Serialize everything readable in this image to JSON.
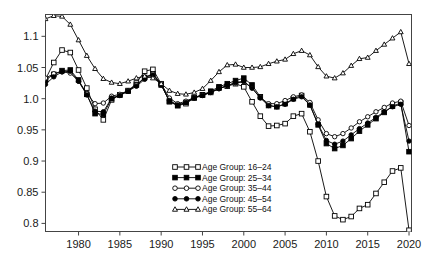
{
  "chart_data": {
    "type": "line",
    "title": "",
    "subtitle": "",
    "xlabel": "",
    "ylabel": "",
    "xlim": [
      1976,
      2020.3
    ],
    "ylim": [
      0.787,
      1.135
    ],
    "grid": false,
    "legend_position": "bottom-center",
    "xticks": [
      1980,
      1985,
      1990,
      1995,
      2000,
      2005,
      2010,
      2015,
      2020
    ],
    "xtick_labels": [
      "1980",
      "1985",
      "1990",
      "1995",
      "2000",
      "2005",
      "2010",
      "2015",
      "2020"
    ],
    "yticks": [
      0.8,
      0.85,
      0.9,
      0.95,
      1.0,
      1.05,
      1.1
    ],
    "ytick_labels": [
      "0.8",
      "0.85",
      "0.9",
      "0.95",
      "1.0",
      "1.05",
      "1.1"
    ],
    "x": [
      1976,
      1977,
      1978,
      1979,
      1980,
      1981,
      1982,
      1983,
      1984,
      1985,
      1986,
      1987,
      1988,
      1989,
      1990,
      1991,
      1992,
      1993,
      1994,
      1995,
      1996,
      1997,
      1998,
      1999,
      2000,
      2001,
      2002,
      2003,
      2004,
      2005,
      2006,
      2007,
      2008,
      2009,
      2010,
      2011,
      2012,
      2013,
      2014,
      2015,
      2016,
      2017,
      2018,
      2019,
      2020
    ],
    "series": [
      {
        "name": "Age Group: 16–24",
        "marker": "open-square",
        "color": "#000000",
        "values": [
          1.031,
          1.058,
          1.078,
          1.074,
          1.046,
          1.017,
          0.983,
          0.966,
          0.998,
          1.006,
          1.012,
          1.025,
          1.044,
          1.047,
          1.024,
          0.995,
          0.989,
          0.992,
          1.001,
          1.006,
          1.01,
          1.017,
          1.02,
          1.024,
          1.019,
          0.995,
          0.972,
          0.956,
          0.957,
          0.96,
          0.972,
          0.976,
          0.947,
          0.9,
          0.843,
          0.812,
          0.806,
          0.811,
          0.824,
          0.83,
          0.848,
          0.866,
          0.884,
          0.889,
          0.789
        ]
      },
      {
        "name": "Age Group: 25–34",
        "marker": "filled-square",
        "color": "#000000",
        "values": [
          1.03,
          1.039,
          1.045,
          1.046,
          1.03,
          1.007,
          0.976,
          0.975,
          1.0,
          1.006,
          1.013,
          1.022,
          1.034,
          1.04,
          1.022,
          0.996,
          0.989,
          0.994,
          1.002,
          1.006,
          1.012,
          1.019,
          1.024,
          1.029,
          1.033,
          1.022,
          1.003,
          0.989,
          0.987,
          0.992,
          1.0,
          1.005,
          0.99,
          0.958,
          0.928,
          0.92,
          0.925,
          0.936,
          0.948,
          0.958,
          0.968,
          0.978,
          0.988,
          0.993,
          0.915
        ]
      },
      {
        "name": "Age Group: 35–44",
        "marker": "open-circle",
        "color": "#000000",
        "values": [
          1.033,
          1.04,
          1.043,
          1.041,
          1.028,
          1.008,
          0.992,
          0.993,
          1.004,
          1.007,
          1.013,
          1.022,
          1.033,
          1.04,
          1.024,
          1.001,
          0.992,
          0.996,
          1.002,
          1.006,
          1.01,
          1.016,
          1.021,
          1.025,
          1.027,
          1.017,
          1.002,
          0.992,
          0.992,
          0.997,
          1.003,
          1.006,
          0.994,
          0.966,
          0.944,
          0.939,
          0.944,
          0.953,
          0.963,
          0.971,
          0.979,
          0.986,
          0.993,
          0.996,
          0.957
        ]
      },
      {
        "name": "Age Group: 45–54",
        "marker": "filled-circle",
        "color": "#000000",
        "values": [
          1.023,
          1.035,
          1.043,
          1.044,
          1.028,
          1.006,
          0.98,
          0.979,
          1.001,
          1.005,
          1.012,
          1.02,
          1.031,
          1.038,
          1.022,
          0.997,
          0.99,
          0.994,
          1.001,
          1.005,
          1.01,
          1.016,
          1.021,
          1.026,
          1.028,
          1.017,
          1.001,
          0.989,
          0.987,
          0.991,
          0.999,
          1.003,
          0.99,
          0.959,
          0.933,
          0.927,
          0.932,
          0.942,
          0.952,
          0.961,
          0.97,
          0.979,
          0.987,
          0.991,
          0.932
        ]
      },
      {
        "name": "Age Group: 55–64",
        "marker": "open-triangle",
        "color": "#000000",
        "values": [
          1.128,
          1.133,
          1.132,
          1.119,
          1.094,
          1.069,
          1.048,
          1.032,
          1.026,
          1.024,
          1.028,
          1.033,
          1.036,
          1.033,
          1.024,
          1.013,
          1.008,
          1.007,
          1.01,
          1.016,
          1.029,
          1.043,
          1.054,
          1.055,
          1.05,
          1.05,
          1.051,
          1.056,
          1.06,
          1.063,
          1.072,
          1.077,
          1.07,
          1.051,
          1.036,
          1.033,
          1.041,
          1.053,
          1.064,
          1.066,
          1.077,
          1.087,
          1.097,
          1.107,
          1.056
        ]
      }
    ],
    "legend": [
      {
        "label": "Age Group: 16–24",
        "marker": "open-square"
      },
      {
        "label": "Age Group: 25–34",
        "marker": "filled-square"
      },
      {
        "label": "Age Group: 35–44",
        "marker": "open-circle"
      },
      {
        "label": "Age Group: 45–54",
        "marker": "filled-circle"
      },
      {
        "label": "Age Group: 55–64",
        "marker": "open-triangle"
      }
    ]
  }
}
